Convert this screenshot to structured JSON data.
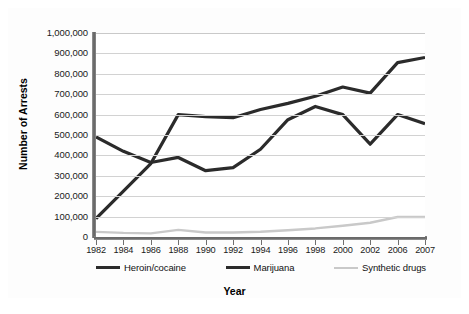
{
  "chart_data": {
    "type": "line",
    "title": "",
    "xlabel": "Year",
    "ylabel": "Number of Arrests",
    "categories": [
      "1982",
      "1984",
      "1986",
      "1988",
      "1990",
      "1992",
      "1994",
      "1996",
      "1998",
      "2000",
      "2002",
      "2006",
      "2007"
    ],
    "ylim": [
      0,
      1000000
    ],
    "ytick_values": [
      0,
      100000,
      200000,
      300000,
      400000,
      500000,
      600000,
      700000,
      800000,
      900000,
      1000000
    ],
    "ytick_labels": [
      "0",
      "100,000",
      "200,000",
      "300,000",
      "400,000",
      "500,000",
      "600,000",
      "700,000",
      "800,000",
      "900,000",
      "1,000,000"
    ],
    "grid": true,
    "legend_position": "bottom",
    "series": [
      {
        "name": "Heroin/cocaine",
        "color": "#2b2b2b",
        "width": 3.2,
        "values": [
          90000,
          225000,
          360000,
          600000,
          590000,
          585000,
          625000,
          655000,
          690000,
          735000,
          705000,
          855000,
          880000
        ]
      },
      {
        "name": "Marijuana",
        "color": "#2b2b2b",
        "width": 3.2,
        "values": [
          490000,
          420000,
          365000,
          390000,
          325000,
          340000,
          430000,
          575000,
          640000,
          600000,
          455000,
          600000,
          555000
        ]
      },
      {
        "name": "Synthetic drugs",
        "color": "#c9c9c9",
        "width": 2.4,
        "values": [
          25000,
          20000,
          18000,
          35000,
          22000,
          22000,
          26000,
          33000,
          42000,
          55000,
          70000,
          98000,
          98000
        ]
      }
    ]
  },
  "legend": {
    "items": [
      {
        "label": "Heroin/cocaine",
        "color": "#2b2b2b"
      },
      {
        "label": "Marijuana",
        "color": "#2b2b2b"
      },
      {
        "label": "Synthetic drugs",
        "color": "#c9c9c9"
      }
    ]
  }
}
